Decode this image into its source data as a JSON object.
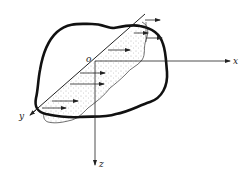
{
  "diagram": {
    "type": "cross-section stress distribution",
    "labels": {
      "origin": "o",
      "x_axis": "x",
      "y_axis": "y",
      "z_axis": "z"
    },
    "colors": {
      "outline": "#111111",
      "axis": "#222222",
      "stipple": "#888888",
      "background": "#ffffff"
    }
  }
}
